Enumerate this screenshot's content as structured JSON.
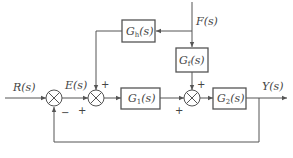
{
  "diagram": {
    "type": "control-system-block-diagram",
    "signals": {
      "input": "R(s)",
      "error": "E(s)",
      "disturbance": "F(s)",
      "output": "Y(s)"
    },
    "blocks": [
      {
        "id": "gh",
        "label": "G",
        "sub": "h",
        "suffix": "(s)"
      },
      {
        "id": "gf",
        "label": "G",
        "sub": "f",
        "suffix": "(s)"
      },
      {
        "id": "g1",
        "label": "G",
        "sub": "1",
        "suffix": "(s)"
      },
      {
        "id": "g2",
        "label": "G",
        "sub": "2",
        "suffix": "(s)"
      }
    ],
    "summing_junctions": [
      {
        "id": "sum1",
        "signs": [
          "+",
          "−"
        ]
      },
      {
        "id": "sum2",
        "signs": [
          "+",
          "+"
        ]
      },
      {
        "id": "sum3",
        "signs": [
          "+",
          "+"
        ]
      }
    ],
    "line_color": "#555555"
  }
}
